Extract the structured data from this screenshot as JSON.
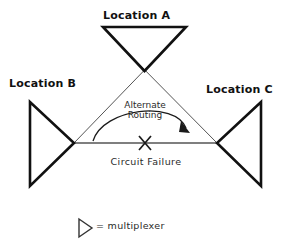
{
  "diagram": {
    "title_visible": false,
    "nodes": [
      {
        "id": "a",
        "label": "Location A",
        "icon": "multiplexer-triangle-down"
      },
      {
        "id": "b",
        "label": "Location B",
        "icon": "multiplexer-triangle-right"
      },
      {
        "id": "c",
        "label": "Location C",
        "icon": "multiplexer-triangle-left"
      }
    ],
    "annotations": {
      "alternate_routing_line1": "Alternate",
      "alternate_routing_line2": "Routing",
      "circuit_failure": "Circuit Failure",
      "failure_marker": "X"
    },
    "legend": {
      "symbol": "multiplexer-triangle-right",
      "text": "= multiplexer"
    },
    "colors": {
      "background": "#ffffff",
      "stroke_heavy": "#111111",
      "stroke_light": "#555555",
      "text": "#1a1a1a"
    }
  }
}
